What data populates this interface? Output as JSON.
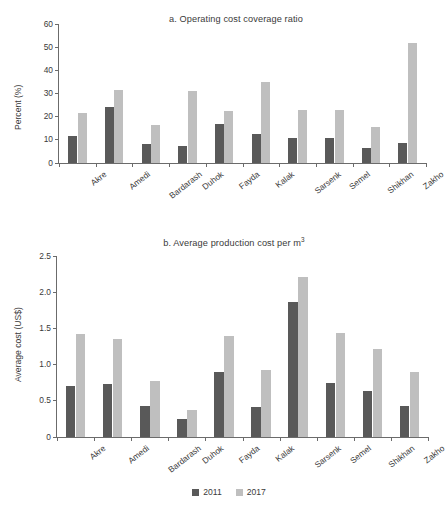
{
  "chart_data": [
    {
      "type": "bar",
      "panel": "a",
      "title": "a. Operating cost coverage ratio",
      "title_prefix": "a. Operating cost coverage ratio",
      "title_suffix": "",
      "xlabel": "",
      "ylabel": "Percent (%)",
      "ylim": [
        0,
        60
      ],
      "yticks": [
        0,
        10,
        20,
        30,
        40,
        50,
        60
      ],
      "ytick_labels": [
        "0",
        "10",
        "20",
        "30",
        "40",
        "50",
        "60"
      ],
      "grid": false,
      "legend_position": "bottom-center-shared",
      "categories": [
        "Akre",
        "Amedi",
        "Bardarash",
        "Duhok",
        "Fayda",
        "Kalak",
        "Sarsenk",
        "Semel",
        "Shikhan",
        "Zakho"
      ],
      "series": [
        {
          "name": "2011",
          "color": "#595959",
          "values": [
            11.6,
            24.1,
            8.4,
            7.4,
            16.8,
            12.7,
            10.8,
            10.8,
            6.5,
            8.5
          ]
        },
        {
          "name": "2017",
          "color": "#bfbfbf",
          "values": [
            21.5,
            31.7,
            16.2,
            31.0,
            22.4,
            35.1,
            23.1,
            22.9,
            15.6,
            51.7
          ]
        }
      ]
    },
    {
      "type": "bar",
      "panel": "b",
      "title": "b. Average production cost per m³",
      "title_prefix": "b. Average production cost per m",
      "title_suffix": "3",
      "xlabel": "",
      "ylabel": "Average cost (US$)",
      "ylim": [
        0,
        2.5
      ],
      "yticks": [
        0,
        0.5,
        1.0,
        1.5,
        2.0,
        2.5
      ],
      "ytick_labels": [
        "0",
        "0.5",
        "1.0",
        "1.5",
        "2.0",
        "2.5"
      ],
      "grid": false,
      "legend_position": "bottom-center-shared",
      "categories": [
        "Akre",
        "Amedi",
        "Bardarash",
        "Duhok",
        "Fayda",
        "Kalak",
        "Sarsenk",
        "Semel",
        "Shikhan",
        "Zakho"
      ],
      "series": [
        {
          "name": "2011",
          "color": "#595959",
          "values": [
            0.7,
            0.73,
            0.43,
            0.25,
            0.9,
            0.41,
            1.87,
            0.75,
            0.64,
            0.43
          ]
        },
        {
          "name": "2017",
          "color": "#bfbfbf",
          "values": [
            1.42,
            1.35,
            0.78,
            0.37,
            1.39,
            0.93,
            2.21,
            1.44,
            1.22,
            0.9
          ]
        }
      ]
    }
  ],
  "legend": {
    "items": [
      {
        "label": "2011",
        "color": "#595959"
      },
      {
        "label": "2017",
        "color": "#bfbfbf"
      }
    ]
  }
}
